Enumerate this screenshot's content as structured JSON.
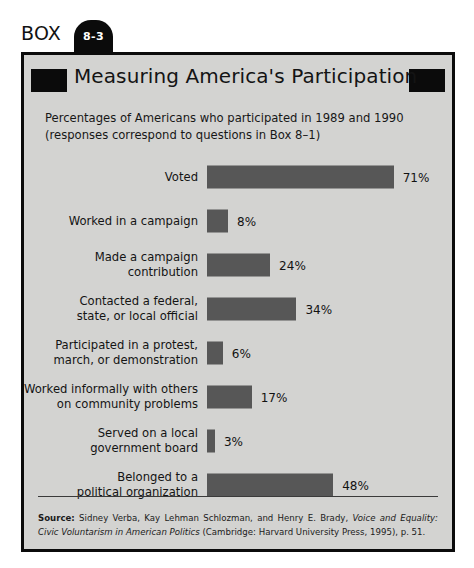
{
  "box": {
    "word": "BOX",
    "number": "8-3",
    "title": "Measuring America's Participation",
    "subtitle_line1": "Percentages of Americans who participated in 1989 and 1990",
    "subtitle_line2": "(responses correspond to questions in Box 8–1)"
  },
  "colors": {
    "box_background": "#d3d3d1",
    "box_border": "#0b0b0b",
    "bar_fill": "#575757",
    "title_block": "#0b0b0b",
    "text": "#141414"
  },
  "source": {
    "label": "Source:",
    "text_part1": " Sidney Verba, Kay Lehman Schlozman, and Henry E. Brady, ",
    "italic1": "Voice and Equality: Civic Voluntarism in American Politics",
    "text_part2": " (Cambridge: Harvard University Press, 1995), p. 51."
  },
  "chart_data": {
    "type": "bar",
    "orientation": "horizontal",
    "title": "Measuring America's Participation",
    "subtitle": "Percentages of Americans who participated in 1989 and 1990 (responses correspond to questions in Box 8–1)",
    "xlabel": "",
    "ylabel": "",
    "xlim": [
      0,
      100
    ],
    "grid": false,
    "legend": "none",
    "value_suffix": "%",
    "categories": [
      "Voted",
      "Worked in a campaign",
      "Made a campaign contribution",
      "Contacted a federal, state, or local official",
      "Participated in a protest, march, or demonstration",
      "Worked informally with others on community problems",
      "Served on a local government board",
      "Belonged to a political organization"
    ],
    "values": [
      71,
      8,
      24,
      34,
      6,
      17,
      3,
      48
    ],
    "bars": [
      {
        "label_lines": [
          "Voted"
        ],
        "value": 71,
        "value_label": "71%"
      },
      {
        "label_lines": [
          "Worked in a campaign"
        ],
        "value": 8,
        "value_label": "8%"
      },
      {
        "label_lines": [
          "Made a campaign",
          "contribution"
        ],
        "value": 24,
        "value_label": "24%"
      },
      {
        "label_lines": [
          "Contacted a federal,",
          "state, or local official"
        ],
        "value": 34,
        "value_label": "34%"
      },
      {
        "label_lines": [
          "Participated in a protest,",
          "march, or demonstration"
        ],
        "value": 6,
        "value_label": "6%"
      },
      {
        "label_lines": [
          "Worked informally with others",
          "on community problems"
        ],
        "value": 17,
        "value_label": "17%"
      },
      {
        "label_lines": [
          "Served on a local",
          "government board"
        ],
        "value": 3,
        "value_label": "3%"
      },
      {
        "label_lines": [
          "Belonged to a",
          "political organization"
        ],
        "value": 48,
        "value_label": "48%"
      }
    ]
  }
}
